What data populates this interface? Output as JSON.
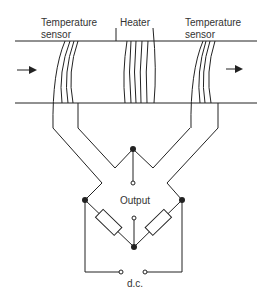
{
  "diagram": {
    "labels": {
      "left_sensor_line1": "Temperature",
      "left_sensor_line2": "sensor",
      "heater": "Heater",
      "right_sensor_line1": "Temperature",
      "right_sensor_line2": "sensor",
      "output": "Output",
      "supply": "d.c."
    },
    "flow_direction": "left-to-right",
    "components": [
      "pipe",
      "upstream temperature sensor coil",
      "heater coil",
      "downstream temperature sensor coil",
      "bridge resistor left",
      "bridge resistor right",
      "output terminals",
      "d.c. supply terminals"
    ],
    "colors": {
      "line": "#222222",
      "text": "#333333",
      "background": "#ffffff"
    }
  }
}
